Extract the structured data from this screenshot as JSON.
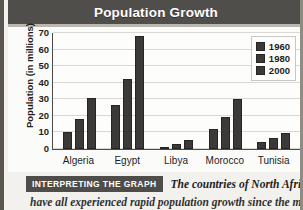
{
  "header": {
    "title": "Population Growth"
  },
  "legend": {
    "position": "top-right",
    "entries": [
      {
        "label": "1960",
        "color": "#3b3a38"
      },
      {
        "label": "1980",
        "color": "#3b3a38"
      },
      {
        "label": "2000",
        "color": "#3b3a38"
      }
    ]
  },
  "caption": {
    "badge": "INTERPRETING THE GRAPH",
    "text_line1": "The countries of North Africa",
    "text_line2": "have all experienced rapid population growth since the mid-"
  },
  "colors": {
    "title_bar": "#504e4a",
    "bar": "#3b3a38",
    "badge": "#4f4d49",
    "plot_background": "#fdfdfc",
    "gridline": "#d9d8d4"
  },
  "chart_data": {
    "type": "bar",
    "title": "Population Growth",
    "xlabel": "",
    "ylabel": "Population (in millions)",
    "ylim": [
      0,
      70
    ],
    "yticks": [
      0,
      10,
      20,
      30,
      40,
      50,
      60,
      70
    ],
    "grid": true,
    "categories": [
      "Algeria",
      "Egypt",
      "Libya",
      "Morocco",
      "Tunisia"
    ],
    "series": [
      {
        "name": "1960",
        "values": [
          10.5,
          26.5,
          1.3,
          12.2,
          4.2
        ]
      },
      {
        "name": "1980",
        "values": [
          18.3,
          42.3,
          3.0,
          19.5,
          6.5
        ]
      },
      {
        "name": "2000",
        "values": [
          31.0,
          68.0,
          5.3,
          30.3,
          9.7
        ]
      }
    ]
  }
}
